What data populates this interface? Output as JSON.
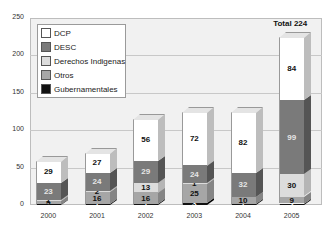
{
  "chart_data": {
    "type": "bar",
    "stacked": true,
    "title": "",
    "xlabel": "",
    "ylabel": "",
    "ylim": [
      0,
      250
    ],
    "yticks": [
      0,
      50,
      100,
      150,
      200,
      250
    ],
    "grid": true,
    "legend_position": "upper-left",
    "categories": [
      "2000",
      "2001",
      "2002",
      "2003",
      "2004",
      "2005"
    ],
    "series": [
      {
        "name": "Gubernamentales",
        "color": "#111111",
        "label_color": "#ffffff",
        "values": [
          1,
          1,
          1,
          3,
          1,
          2
        ]
      },
      {
        "name": "Otros",
        "color": "#a6a6a6",
        "label_color": "#111111",
        "values": [
          5,
          16,
          16,
          25,
          10,
          9
        ]
      },
      {
        "name": "Derechos Indigenas",
        "color": "#dcdcdc",
        "label_color": "#111111",
        "values": [
          1,
          2,
          13,
          1,
          0,
          30
        ]
      },
      {
        "name": "DESC",
        "color": "#7a7a7a",
        "label_color": "#e6e6e6",
        "values": [
          23,
          24,
          29,
          24,
          32,
          99
        ]
      },
      {
        "name": "DCP",
        "color": "#ffffff",
        "label_color": "#111111",
        "values": [
          29,
          27,
          56,
          72,
          82,
          84
        ]
      }
    ],
    "annotations": [
      {
        "text": "Total  224",
        "category": "2005"
      }
    ]
  },
  "legend": {
    "items": [
      {
        "label": "DCP",
        "color": "#ffffff"
      },
      {
        "label": "DESC",
        "color": "#7a7a7a"
      },
      {
        "label": "Derechos Indigenas",
        "color": "#dcdcdc"
      },
      {
        "label": "Otros",
        "color": "#a6a6a6"
      },
      {
        "label": "Gubernamentales",
        "color": "#111111"
      }
    ]
  },
  "total_label": "Total  224"
}
